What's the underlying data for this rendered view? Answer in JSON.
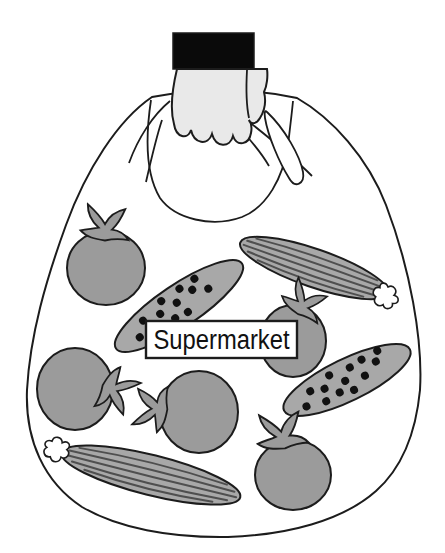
{
  "label": {
    "text": "Supermarket"
  },
  "bag": {
    "description": "plastic carrier bag held by a hand with a black sleeve",
    "item_counts": {
      "tomatoes": 5,
      "cucumbers": 4
    },
    "items": [
      {
        "kind": "tomato",
        "variant": "plain",
        "position": "top-left"
      },
      {
        "kind": "cucumber",
        "variant": "striped",
        "position": "top-right"
      },
      {
        "kind": "cucumber",
        "variant": "dotted",
        "position": "center"
      },
      {
        "kind": "tomato",
        "variant": "plain",
        "position": "middle-right"
      },
      {
        "kind": "tomato",
        "variant": "plain",
        "position": "middle-left"
      },
      {
        "kind": "tomato",
        "variant": "plain",
        "position": "center"
      },
      {
        "kind": "cucumber",
        "variant": "dotted",
        "position": "right"
      },
      {
        "kind": "tomato",
        "variant": "plain",
        "position": "bottom-right"
      },
      {
        "kind": "cucumber",
        "variant": "striped",
        "position": "bottom-left"
      }
    ]
  },
  "colors": {
    "background": "#ffffff",
    "outline": "#1c1c1c",
    "sleeve": "#0a0a0a",
    "hand": "#e9e9e9",
    "tomato": "#9b9b9b",
    "cucumber": "#a8a8a8",
    "stripe": "#4f4f4f",
    "dot": "#111111",
    "label-bg": "#ffffff",
    "label-text": "#111111"
  }
}
